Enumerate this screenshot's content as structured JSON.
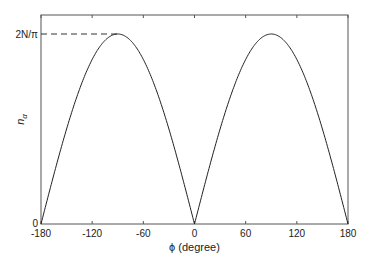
{
  "chart_data": {
    "type": "line",
    "title": "",
    "xlabel": "ϕ (degree)",
    "ylabel": "n",
    "ylabel_subscript": "α",
    "xlim": [
      -180,
      180
    ],
    "ylim": [
      0,
      1.1
    ],
    "x_ticks": [
      -180,
      -120,
      -60,
      0,
      60,
      120,
      180
    ],
    "x_tick_labels": [
      "-180",
      "-120",
      "-60",
      "0",
      "60",
      "120",
      "180"
    ],
    "y_tick_labels": [
      "0",
      "2N/π"
    ],
    "grid": false,
    "annotation": "dashed line from y-axis to peak at 2N/π",
    "series": [
      {
        "name": "n_alpha",
        "formula": "(2N/π)|sin ϕ|",
        "x": [
          -180,
          -150,
          -120,
          -90,
          -60,
          -30,
          0,
          30,
          60,
          90,
          120,
          150,
          180
        ],
        "values": [
          0,
          0.5,
          0.866,
          1.0,
          0.866,
          0.5,
          0,
          0.5,
          0.866,
          1.0,
          0.866,
          0.5,
          0
        ]
      }
    ]
  },
  "labels": {
    "y_top": "2N/π",
    "y_zero": "0",
    "xlabel": "ϕ (degree)",
    "ylabel_main": "n",
    "ylabel_sub": "α"
  }
}
